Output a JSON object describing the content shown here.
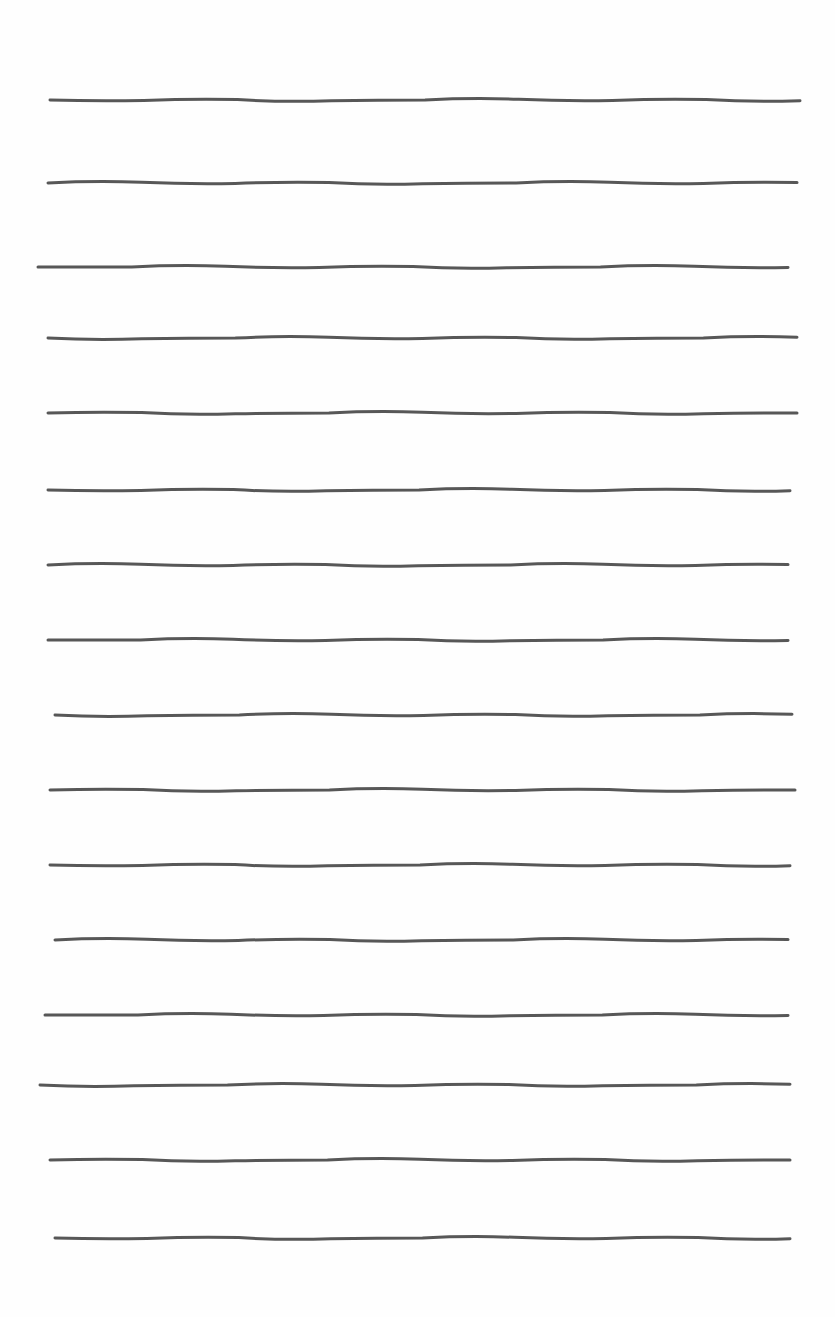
{
  "page": {
    "background": "#fefefe",
    "ink_color": "#3a3a3a",
    "line_count": 16,
    "lines": [
      {
        "y": 100,
        "x1": 50,
        "x2": 800
      },
      {
        "y": 183,
        "x1": 48,
        "x2": 797
      },
      {
        "y": 267,
        "x1": 38,
        "x2": 788
      },
      {
        "y": 338,
        "x1": 48,
        "x2": 797
      },
      {
        "y": 413,
        "x1": 48,
        "x2": 797
      },
      {
        "y": 490,
        "x1": 48,
        "x2": 790
      },
      {
        "y": 565,
        "x1": 48,
        "x2": 788
      },
      {
        "y": 640,
        "x1": 48,
        "x2": 788
      },
      {
        "y": 715,
        "x1": 55,
        "x2": 792
      },
      {
        "y": 790,
        "x1": 50,
        "x2": 795
      },
      {
        "y": 865,
        "x1": 50,
        "x2": 790
      },
      {
        "y": 940,
        "x1": 55,
        "x2": 788
      },
      {
        "y": 1015,
        "x1": 45,
        "x2": 788
      },
      {
        "y": 1085,
        "x1": 40,
        "x2": 790
      },
      {
        "y": 1160,
        "x1": 50,
        "x2": 790
      },
      {
        "y": 1238,
        "x1": 55,
        "x2": 790
      }
    ]
  }
}
